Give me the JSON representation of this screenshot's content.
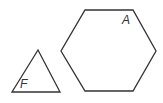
{
  "diagram": {
    "shapes": [
      {
        "id": "F",
        "type": "triangle",
        "label": "F",
        "points": "38,50 12,92 60,92",
        "label_pos": {
          "x": 20,
          "y": 88
        }
      },
      {
        "id": "A",
        "type": "hexagon",
        "label": "A",
        "points": "85,10 133,10 156,51 133,91 85,91 61,51",
        "label_pos": {
          "x": 122,
          "y": 24
        }
      }
    ],
    "stroke_color": "#333333",
    "background": "#ffffff"
  }
}
